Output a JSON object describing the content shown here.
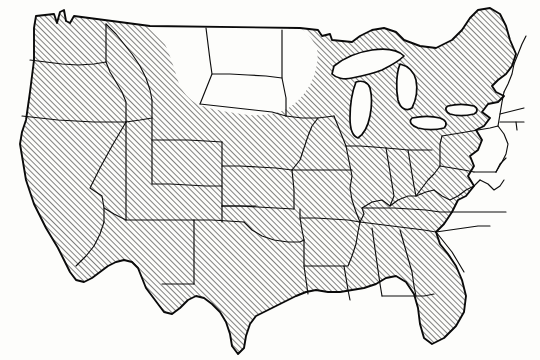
{
  "figure": {
    "title": "United States choropleth map with diagonal hatching",
    "width": 540,
    "height": 360,
    "background_color": "#fdfdfb",
    "line_color": "#0a0a0a",
    "hatch_color": "#1a1a1a",
    "hatch_angle_degrees": 45,
    "hatch_spacing_px": 4,
    "hatch_stroke_width_px": 1.1
  },
  "legend": {
    "visible": false,
    "entries": [
      {
        "label": "Hatched",
        "pattern": "diagonal-45",
        "meaning": "included"
      },
      {
        "label": "Unhatched",
        "pattern": "none",
        "meaning": "excluded"
      }
    ]
  },
  "chart_data": {
    "type": "map",
    "title": "",
    "subtitle": "",
    "xlabel": "",
    "ylabel": "",
    "projection": "conic",
    "categories": [
      "hatched",
      "unhatched"
    ],
    "region_counts": {
      "hatched": 44,
      "unhatched": 4
    },
    "regions": [
      {
        "name": "Washington",
        "state": true,
        "fill": "hatched"
      },
      {
        "name": "Oregon",
        "state": true,
        "fill": "hatched"
      },
      {
        "name": "California",
        "state": true,
        "fill": "hatched"
      },
      {
        "name": "Nevada",
        "state": true,
        "fill": "hatched"
      },
      {
        "name": "Idaho",
        "state": true,
        "fill": "hatched"
      },
      {
        "name": "Utah",
        "state": true,
        "fill": "hatched"
      },
      {
        "name": "Arizona",
        "state": true,
        "fill": "hatched"
      },
      {
        "name": "Montana",
        "state": true,
        "fill": "unhatched"
      },
      {
        "name": "Wyoming",
        "state": true,
        "fill": "partial-unhatched"
      },
      {
        "name": "Colorado",
        "state": true,
        "fill": "hatched"
      },
      {
        "name": "New Mexico",
        "state": true,
        "fill": "hatched"
      },
      {
        "name": "North Dakota",
        "state": true,
        "fill": "unhatched"
      },
      {
        "name": "South Dakota",
        "state": true,
        "fill": "unhatched"
      },
      {
        "name": "Nebraska",
        "state": true,
        "fill": "partial-unhatched"
      },
      {
        "name": "Kansas",
        "state": true,
        "fill": "hatched"
      },
      {
        "name": "Oklahoma",
        "state": true,
        "fill": "hatched"
      },
      {
        "name": "Texas",
        "state": true,
        "fill": "hatched"
      },
      {
        "name": "Minnesota",
        "state": true,
        "fill": "unhatched"
      },
      {
        "name": "Iowa",
        "state": true,
        "fill": "hatched"
      },
      {
        "name": "Missouri",
        "state": true,
        "fill": "hatched"
      },
      {
        "name": "Arkansas",
        "state": true,
        "fill": "hatched"
      },
      {
        "name": "Louisiana",
        "state": true,
        "fill": "hatched"
      },
      {
        "name": "Wisconsin",
        "state": true,
        "fill": "hatched"
      },
      {
        "name": "Illinois",
        "state": true,
        "fill": "hatched"
      },
      {
        "name": "Michigan",
        "state": true,
        "fill": "hatched"
      },
      {
        "name": "Indiana",
        "state": true,
        "fill": "hatched"
      },
      {
        "name": "Ohio",
        "state": true,
        "fill": "hatched"
      },
      {
        "name": "Kentucky",
        "state": true,
        "fill": "hatched"
      },
      {
        "name": "Tennessee",
        "state": true,
        "fill": "hatched"
      },
      {
        "name": "Mississippi",
        "state": true,
        "fill": "hatched"
      },
      {
        "name": "Alabama",
        "state": true,
        "fill": "hatched"
      },
      {
        "name": "Georgia",
        "state": true,
        "fill": "hatched"
      },
      {
        "name": "Florida",
        "state": true,
        "fill": "hatched"
      },
      {
        "name": "South Carolina",
        "state": true,
        "fill": "hatched"
      },
      {
        "name": "North Carolina",
        "state": true,
        "fill": "hatched"
      },
      {
        "name": "Virginia",
        "state": true,
        "fill": "hatched"
      },
      {
        "name": "West Virginia",
        "state": true,
        "fill": "hatched"
      },
      {
        "name": "Maryland",
        "state": true,
        "fill": "hatched"
      },
      {
        "name": "Delaware",
        "state": true,
        "fill": "hatched"
      },
      {
        "name": "Pennsylvania",
        "state": true,
        "fill": "hatched"
      },
      {
        "name": "New Jersey",
        "state": true,
        "fill": "hatched"
      },
      {
        "name": "New York",
        "state": true,
        "fill": "hatched"
      },
      {
        "name": "Connecticut",
        "state": true,
        "fill": "hatched"
      },
      {
        "name": "Rhode Island",
        "state": true,
        "fill": "hatched"
      },
      {
        "name": "Massachusetts",
        "state": true,
        "fill": "hatched"
      },
      {
        "name": "Vermont",
        "state": true,
        "fill": "hatched"
      },
      {
        "name": "New Hampshire",
        "state": true,
        "fill": "hatched"
      },
      {
        "name": "Maine",
        "state": true,
        "fill": "hatched"
      }
    ],
    "water_bodies": [
      {
        "name": "Lake Superior",
        "fill": "unhatched"
      },
      {
        "name": "Lake Michigan",
        "fill": "unhatched"
      },
      {
        "name": "Lake Huron",
        "fill": "unhatched"
      },
      {
        "name": "Lake Erie",
        "fill": "unhatched"
      },
      {
        "name": "Lake Ontario",
        "fill": "unhatched"
      }
    ],
    "annotations": [],
    "grid": false,
    "legend_position": "none"
  }
}
